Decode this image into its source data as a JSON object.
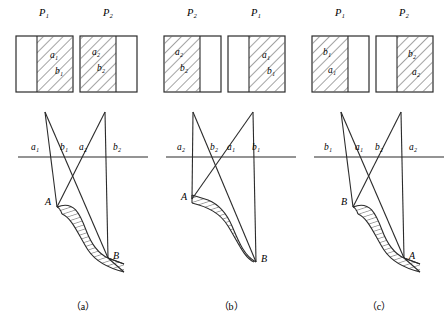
{
  "figure": {
    "type": "technical-diagram",
    "panel_count": 3,
    "line_color": "#2b2b2b",
    "hatch_color": "#4a4a4a",
    "background": "#ffffff"
  },
  "panels": [
    {
      "id": "a",
      "caption": "（a）",
      "plates": [
        {
          "name": "P1",
          "title": "P₁",
          "hatch_side": "right",
          "labels": [
            "a₁",
            "b₁"
          ],
          "label_top": "a₁",
          "label_bottom": "b₁"
        },
        {
          "name": "P2",
          "title": "P₂",
          "hatch_side": "left",
          "labels": [
            "a₂",
            "b₂"
          ],
          "label_top": "a₂",
          "label_bottom": "b₂"
        }
      ],
      "baseline_labels": [
        "a₁",
        "b₁",
        "a₂",
        "b₂"
      ],
      "terrain_points": {
        "upper": "A",
        "lower": "B",
        "upper_side": "left",
        "lower_side": "right"
      }
    },
    {
      "id": "b",
      "caption": "（b）",
      "plates": [
        {
          "name": "P2",
          "title": "P₂",
          "hatch_side": "left",
          "labels": [
            "a₂",
            "b₂"
          ],
          "label_top": "a₂",
          "label_bottom": "b₂"
        },
        {
          "name": "P1",
          "title": "P₁",
          "hatch_side": "right",
          "labels": [
            "a₁",
            "b₁"
          ],
          "label_top": "a₁",
          "label_bottom": "b₁"
        }
      ],
      "baseline_labels": [
        "a₂",
        "b₂",
        "a₁",
        "b₁"
      ],
      "terrain_points": {
        "upper": "B",
        "lower": "A",
        "upper_side": "right",
        "lower_side": "left"
      }
    },
    {
      "id": "c",
      "caption": "（c）",
      "plates": [
        {
          "name": "P1",
          "title": "P₁",
          "hatch_side": "left",
          "labels": [
            "b₁",
            "a₁"
          ],
          "label_top": "b₁",
          "label_bottom": "a₁"
        },
        {
          "name": "P2",
          "title": "P₂",
          "hatch_side": "right",
          "labels": [
            "b₂",
            "a₂"
          ],
          "label_top": "b₂",
          "label_bottom": "a₂"
        }
      ],
      "baseline_labels": [
        "b₁",
        "a₁",
        "b₂",
        "a₂"
      ],
      "terrain_points": {
        "upper": "B",
        "lower": "A",
        "upper_side": "left",
        "lower_side": "right"
      }
    }
  ]
}
